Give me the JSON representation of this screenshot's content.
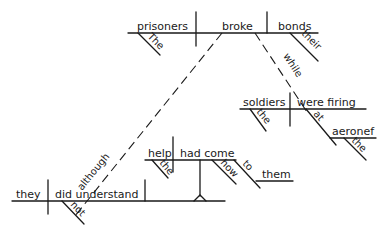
{
  "diagram": {
    "type": "Reed-Kellogg sentence diagram",
    "main_clause": {
      "subject": "prisoners",
      "subject_modifier": "The",
      "verb": "broke",
      "object": "bonds",
      "object_modifier": "their"
    },
    "while_clause": {
      "connector": "while",
      "subject": "soldiers",
      "subject_modifier": "the",
      "verb": "were firing",
      "preposition": "at",
      "prep_object": "aeronef",
      "prep_object_modifier": "the"
    },
    "although_clause": {
      "connector": "although",
      "subject": "they",
      "verb": "did understand",
      "verb_modifier": "not"
    },
    "noun_clause": {
      "subject": "help",
      "subject_modifier": "the",
      "verb": "had come",
      "adverb": "how",
      "preposition": "to",
      "prep_object": "them"
    }
  }
}
